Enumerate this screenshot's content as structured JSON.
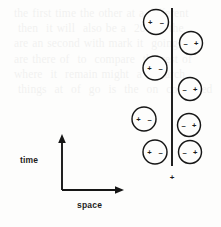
{
  "figure": {
    "kind": "spacetime-diagram",
    "background_color": "#fdfdfc",
    "ink_color": "#161616",
    "axes": {
      "time_label": "time",
      "space_label": "space",
      "origin": {
        "x": 62,
        "y": 190
      },
      "vertical_top": {
        "x": 62,
        "y": 134
      },
      "horizontal_right": {
        "x": 124,
        "y": 190
      }
    },
    "worldline": {
      "name": "vertical-boundary-line",
      "x": 172,
      "y_top": 8,
      "y_bottom": 166
    },
    "marker_below_line": {
      "symbol": "+",
      "x": 172,
      "y": 177
    },
    "left_column": {
      "polarity_order": "plus-minus",
      "left_symbol": "+",
      "right_symbol": "–",
      "particles": [
        {
          "cx": 156,
          "cy": 22,
          "r": 12.5
        },
        {
          "cx": 155,
          "cy": 68,
          "r": 12.0
        },
        {
          "cx": 144,
          "cy": 119,
          "r": 12.0
        },
        {
          "cx": 155,
          "cy": 152,
          "r": 12.0
        }
      ]
    },
    "right_column": {
      "polarity_order": "minus-plus",
      "left_symbol": "–",
      "right_symbol": "+",
      "particles": [
        {
          "cx": 191,
          "cy": 43,
          "r": 11.5
        },
        {
          "cx": 190,
          "cy": 89,
          "r": 11.5
        },
        {
          "cx": 189,
          "cy": 125,
          "r": 11.5
        },
        {
          "cx": 190,
          "cy": 152,
          "r": 11.5
        }
      ]
    },
    "bleed_text": "  the first time the other at a different\n   then  it will  also be a  200 of the\n  are an second with mark it  going on\n  are there of  to  compare  the rest of\n  where  it  remain might  a research\n   things  at  of  go  is  the  on  continued\n"
  }
}
